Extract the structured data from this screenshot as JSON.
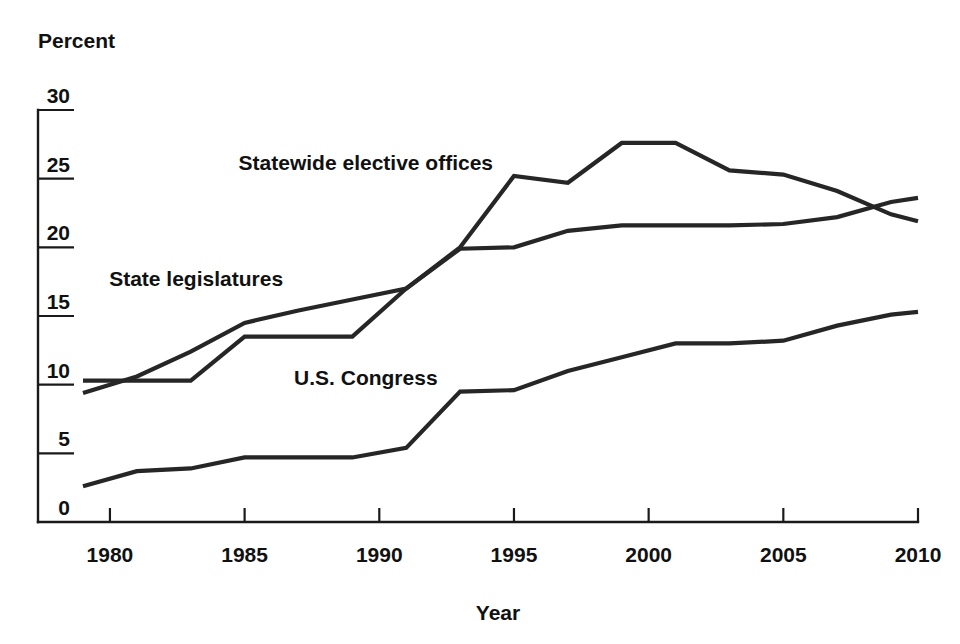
{
  "chart_data": {
    "type": "line",
    "title": "",
    "xlabel": "Year",
    "ylabel": "Percent",
    "xlim": [
      1979,
      2010
    ],
    "ylim": [
      0,
      30
    ],
    "yticks": [
      0,
      5,
      10,
      15,
      20,
      25,
      30
    ],
    "ytick_labels": [
      "0",
      "5",
      "10",
      "15",
      "20",
      "25",
      "30"
    ],
    "xticks": [
      1980,
      1985,
      1990,
      1995,
      2000,
      2005,
      2010
    ],
    "xtick_labels": [
      "1980",
      "1985",
      "1990",
      "1995",
      "2000",
      "2005",
      "2010"
    ],
    "grid": false,
    "legend": "inline-labels",
    "line_color": "#262626",
    "series": [
      {
        "name": "Statewide elective offices",
        "label_x": 1989.5,
        "label_y": 25.6,
        "x": [
          1979,
          1981,
          1983,
          1985,
          1987,
          1989,
          1991,
          1993,
          1995,
          1997,
          1999,
          2001,
          2003,
          2005,
          2007,
          2009,
          2010
        ],
        "values": [
          10.3,
          10.3,
          10.3,
          13.5,
          13.5,
          13.5,
          17.0,
          20.0,
          25.2,
          24.7,
          27.6,
          27.6,
          25.6,
          25.3,
          24.1,
          22.4,
          21.9
        ]
      },
      {
        "name": "State legislatures",
        "label_x": 1983.2,
        "label_y": 17.2,
        "x": [
          1979,
          1981,
          1983,
          1985,
          1987,
          1989,
          1991,
          1993,
          1995,
          1997,
          1999,
          2001,
          2003,
          2005,
          2007,
          2009,
          2010
        ],
        "values": [
          9.4,
          10.6,
          12.4,
          14.5,
          15.4,
          16.2,
          17.0,
          19.9,
          20.0,
          21.2,
          21.6,
          21.6,
          21.6,
          21.7,
          22.2,
          23.3,
          23.6
        ]
      },
      {
        "name": "U.S. Congress",
        "label_x": 1989.5,
        "label_y": 10.0,
        "x": [
          1979,
          1981,
          1983,
          1985,
          1987,
          1989,
          1991,
          1993,
          1995,
          1997,
          1999,
          2001,
          2003,
          2005,
          2007,
          2009,
          2010
        ],
        "values": [
          2.6,
          3.7,
          3.9,
          4.7,
          4.7,
          4.7,
          5.4,
          9.5,
          9.6,
          11.0,
          12.0,
          13.0,
          13.0,
          13.2,
          14.3,
          15.1,
          15.3
        ]
      }
    ]
  }
}
